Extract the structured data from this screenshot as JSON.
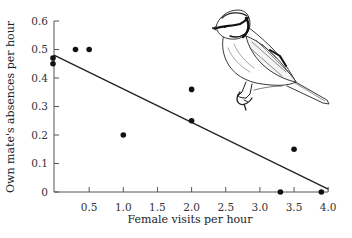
{
  "chart_data": {
    "type": "scatter",
    "title": "",
    "xlabel": "Female visits per hour",
    "ylabel": "Own mate's absences per hour",
    "xlim": [
      0,
      4.0
    ],
    "ylim": [
      0,
      0.6
    ],
    "x_ticks": [
      0.5,
      1.0,
      1.5,
      2.0,
      2.5,
      3.0,
      3.5,
      4.0
    ],
    "x_tick_labels": [
      "0.5",
      "1.0",
      "1.5",
      "2.0",
      "2.5",
      "3.0",
      "3.5",
      "4.0"
    ],
    "y_ticks": [
      0,
      0.1,
      0.2,
      0.3,
      0.4,
      0.5,
      0.6
    ],
    "y_tick_labels": [
      "0",
      "0.1",
      "0.2",
      "0.3",
      "0.4",
      "0.5",
      "0.6"
    ],
    "grid": false,
    "legend": null,
    "series": [
      {
        "name": "observations",
        "points": [
          {
            "x": 0.0,
            "y": 0.47
          },
          {
            "x": 0.0,
            "y": 0.45
          },
          {
            "x": 0.3,
            "y": 0.5
          },
          {
            "x": 0.5,
            "y": 0.5
          },
          {
            "x": 1.0,
            "y": 0.2
          },
          {
            "x": 2.0,
            "y": 0.36
          },
          {
            "x": 2.0,
            "y": 0.25
          },
          {
            "x": 3.3,
            "y": 0.0
          },
          {
            "x": 3.5,
            "y": 0.15
          },
          {
            "x": 3.9,
            "y": 0.0
          }
        ]
      }
    ],
    "regression_line": {
      "x1": 0.0,
      "y1": 0.48,
      "x2": 4.0,
      "y2": 0.01
    },
    "annotations": [
      {
        "type": "illustration",
        "subject": "blue tit bird perched on twig"
      }
    ]
  },
  "colors": {
    "ink": "#111111",
    "axis": "#555555"
  }
}
